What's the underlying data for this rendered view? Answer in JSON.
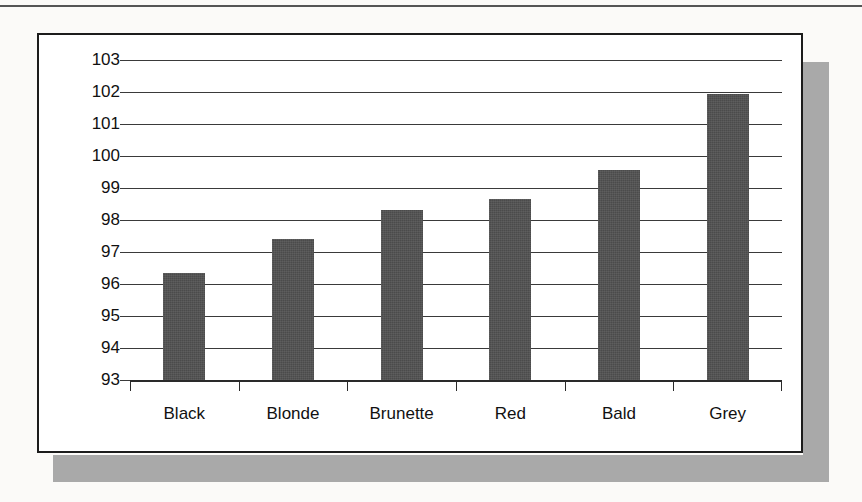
{
  "figure": {
    "frame_color": "#1c1c1c",
    "shadow_color": "#a9a9a9",
    "plot_background": "#ffffff"
  },
  "chart_data": {
    "type": "bar",
    "title": "",
    "subtitle": "",
    "xlabel": "",
    "ylabel": "",
    "categories": [
      "Black",
      "Blonde",
      "Brunette",
      "Red",
      "Bald",
      "Grey"
    ],
    "values": [
      96.35,
      97.4,
      98.3,
      98.65,
      99.55,
      101.95
    ],
    "series": [
      {
        "name": "",
        "values": [
          96.35,
          97.4,
          98.3,
          98.65,
          99.55,
          101.95
        ],
        "color": "#4b4b4b"
      }
    ],
    "ylim": [
      93,
      103
    ],
    "ytick_labels": [
      "103",
      "102",
      "101",
      "100",
      "99",
      "98",
      "97",
      "96",
      "95",
      "94",
      "93"
    ],
    "ytick_values": [
      103,
      102,
      101,
      100,
      99,
      98,
      97,
      96,
      95,
      94,
      93
    ],
    "grid": true,
    "grid_axis": "y",
    "legend": "none",
    "bar_color": "#4b4b4b",
    "gridline_color": "#3a3a3a",
    "axis_color": "#2a2a2a"
  }
}
